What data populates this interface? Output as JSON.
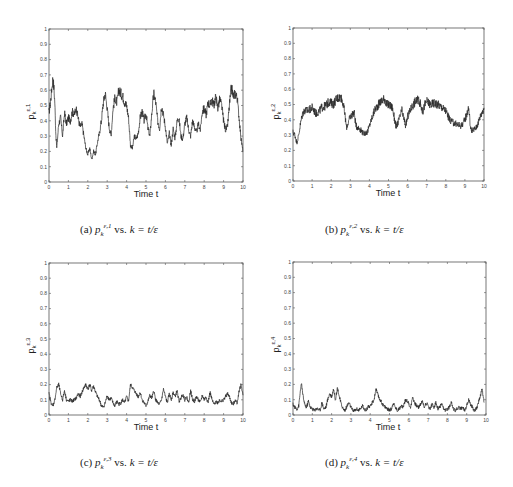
{
  "figure": {
    "captions": [
      {
        "label": "(a)",
        "symbol": "p",
        "sub": "k",
        "sup": "ε,1",
        "text": " vs. ",
        "rhs": "k = t/ε"
      },
      {
        "label": "(b)",
        "symbol": "p",
        "sub": "k",
        "sup": "ε,2",
        "text": " vs. ",
        "rhs": "k = t/ε"
      },
      {
        "label": "(c)",
        "symbol": "p",
        "sub": "k",
        "sup": "ε,3",
        "text": " vs. ",
        "rhs": "k = t/ε"
      },
      {
        "label": "(d)",
        "symbol": "p",
        "sub": "k",
        "sup": "ε,4",
        "text": " vs. ",
        "rhs": "k = t/ε"
      }
    ],
    "line_color": "#2a2a2a",
    "axis_color": "#555555"
  },
  "chart_data": [
    {
      "type": "line",
      "title": "(a) p_k^{ε,1} vs. k = t/ε",
      "xlabel": "Time t",
      "ylabel": "p_k^{ε,1}",
      "xlim": [
        0,
        10
      ],
      "ylim": [
        0,
        1
      ],
      "xticks": [
        0,
        1,
        2,
        3,
        4,
        5,
        6,
        7,
        8,
        9,
        10
      ],
      "yticks": [
        0,
        0.1,
        0.2,
        0.3,
        0.4,
        0.5,
        0.6,
        0.7,
        0.8,
        0.9,
        1
      ],
      "grid": false,
      "x": [
        0,
        0.1,
        0.2,
        0.25,
        0.3,
        0.35,
        0.4,
        0.5,
        0.6,
        0.7,
        0.8,
        0.9,
        1.0,
        1.1,
        1.2,
        1.3,
        1.4,
        1.5,
        1.6,
        1.7,
        1.8,
        1.9,
        2.0,
        2.1,
        2.2,
        2.3,
        2.4,
        2.5,
        2.6,
        2.7,
        2.8,
        2.9,
        3.0,
        3.1,
        3.2,
        3.3,
        3.4,
        3.5,
        3.6,
        3.7,
        3.8,
        3.9,
        4.0,
        4.1,
        4.2,
        4.3,
        4.4,
        4.5,
        4.6,
        4.7,
        4.8,
        4.9,
        5.0,
        5.1,
        5.2,
        5.3,
        5.4,
        5.5,
        5.6,
        5.7,
        5.8,
        5.9,
        6.0,
        6.1,
        6.2,
        6.3,
        6.4,
        6.5,
        6.6,
        6.7,
        6.8,
        6.9,
        7.0,
        7.1,
        7.2,
        7.3,
        7.4,
        7.5,
        7.6,
        7.7,
        7.8,
        7.9,
        8.0,
        8.1,
        8.2,
        8.3,
        8.4,
        8.5,
        8.6,
        8.7,
        8.8,
        8.9,
        9.0,
        9.1,
        9.2,
        9.3,
        9.4,
        9.5,
        9.6,
        9.7,
        9.8,
        9.9,
        10.0
      ],
      "values": [
        0.45,
        0.55,
        0.68,
        0.62,
        0.52,
        0.32,
        0.22,
        0.38,
        0.42,
        0.3,
        0.45,
        0.38,
        0.42,
        0.4,
        0.46,
        0.44,
        0.48,
        0.42,
        0.36,
        0.38,
        0.3,
        0.22,
        0.18,
        0.22,
        0.15,
        0.2,
        0.18,
        0.26,
        0.32,
        0.4,
        0.52,
        0.58,
        0.48,
        0.36,
        0.3,
        0.48,
        0.55,
        0.52,
        0.6,
        0.58,
        0.56,
        0.52,
        0.5,
        0.42,
        0.24,
        0.22,
        0.3,
        0.28,
        0.32,
        0.42,
        0.46,
        0.4,
        0.45,
        0.35,
        0.3,
        0.45,
        0.58,
        0.52,
        0.4,
        0.35,
        0.5,
        0.44,
        0.36,
        0.25,
        0.32,
        0.24,
        0.35,
        0.28,
        0.4,
        0.42,
        0.3,
        0.28,
        0.38,
        0.42,
        0.34,
        0.3,
        0.4,
        0.36,
        0.32,
        0.38,
        0.34,
        0.46,
        0.48,
        0.44,
        0.52,
        0.5,
        0.54,
        0.5,
        0.56,
        0.48,
        0.54,
        0.5,
        0.4,
        0.34,
        0.36,
        0.5,
        0.62,
        0.56,
        0.58,
        0.55,
        0.42,
        0.28,
        0.2
      ]
    },
    {
      "type": "line",
      "title": "(b) p_k^{ε,2} vs. k = t/ε",
      "xlabel": "Time t",
      "ylabel": "p_k^{ε,2}",
      "xlim": [
        0,
        10
      ],
      "ylim": [
        0,
        1
      ],
      "xticks": [
        0,
        1,
        2,
        3,
        4,
        5,
        6,
        7,
        8,
        9,
        10
      ],
      "yticks": [
        0,
        0.1,
        0.2,
        0.3,
        0.4,
        0.5,
        0.6,
        0.7,
        0.8,
        0.9,
        1
      ],
      "grid": false,
      "x": [
        0,
        0.1,
        0.2,
        0.3,
        0.4,
        0.5,
        0.6,
        0.8,
        1.0,
        1.2,
        1.4,
        1.5,
        1.7,
        1.9,
        2.1,
        2.3,
        2.5,
        2.6,
        2.7,
        2.8,
        3.0,
        3.2,
        3.3,
        3.5,
        3.7,
        3.9,
        4.1,
        4.3,
        4.6,
        4.8,
        4.9,
        5.0,
        5.2,
        5.4,
        5.6,
        5.7,
        5.9,
        6.0,
        6.2,
        6.4,
        6.6,
        6.8,
        6.9,
        7.0,
        7.2,
        7.4,
        7.6,
        7.8,
        8.0,
        8.2,
        8.4,
        8.6,
        8.8,
        9.0,
        9.2,
        9.3,
        9.4,
        9.6,
        9.8,
        10.0
      ],
      "values": [
        0.32,
        0.3,
        0.25,
        0.3,
        0.38,
        0.44,
        0.46,
        0.46,
        0.48,
        0.44,
        0.46,
        0.48,
        0.49,
        0.52,
        0.5,
        0.54,
        0.55,
        0.52,
        0.45,
        0.35,
        0.42,
        0.45,
        0.36,
        0.34,
        0.31,
        0.32,
        0.4,
        0.47,
        0.52,
        0.54,
        0.5,
        0.5,
        0.48,
        0.35,
        0.42,
        0.46,
        0.36,
        0.42,
        0.48,
        0.52,
        0.53,
        0.45,
        0.5,
        0.52,
        0.5,
        0.51,
        0.5,
        0.48,
        0.46,
        0.4,
        0.38,
        0.37,
        0.36,
        0.4,
        0.48,
        0.34,
        0.33,
        0.35,
        0.42,
        0.48
      ]
    },
    {
      "type": "line",
      "title": "(c) p_k^{ε,3} vs. k = t/ε",
      "xlabel": "Time t",
      "ylabel": "p_k^{ε,3}",
      "xlim": [
        0,
        10
      ],
      "ylim": [
        0,
        1
      ],
      "xticks": [
        0,
        1,
        2,
        3,
        4,
        5,
        6,
        7,
        8,
        9,
        10
      ],
      "yticks": [
        0,
        0.1,
        0.2,
        0.3,
        0.4,
        0.5,
        0.6,
        0.7,
        0.8,
        0.9,
        1
      ],
      "grid": false,
      "x": [
        0,
        0.1,
        0.2,
        0.3,
        0.4,
        0.5,
        0.6,
        0.7,
        0.8,
        0.9,
        1.0,
        1.1,
        1.2,
        1.3,
        1.4,
        1.5,
        1.6,
        1.7,
        1.8,
        1.9,
        2.0,
        2.1,
        2.2,
        2.3,
        2.4,
        2.5,
        2.6,
        2.7,
        2.8,
        2.9,
        3.0,
        3.1,
        3.2,
        3.3,
        3.4,
        3.5,
        3.6,
        3.7,
        3.8,
        3.9,
        4.0,
        4.1,
        4.2,
        4.3,
        4.4,
        4.5,
        4.6,
        4.7,
        4.8,
        4.9,
        5.0,
        5.1,
        5.2,
        5.3,
        5.4,
        5.5,
        5.6,
        5.7,
        5.8,
        5.9,
        6.0,
        6.1,
        6.2,
        6.3,
        6.4,
        6.5,
        6.6,
        6.7,
        6.8,
        6.9,
        7.0,
        7.1,
        7.2,
        7.3,
        7.4,
        7.5,
        7.6,
        7.7,
        7.8,
        7.9,
        8.0,
        8.1,
        8.2,
        8.3,
        8.4,
        8.5,
        8.6,
        8.7,
        8.8,
        8.9,
        9.0,
        9.1,
        9.2,
        9.3,
        9.4,
        9.5,
        9.6,
        9.7,
        9.8,
        9.9,
        10.0
      ],
      "values": [
        0.14,
        0.08,
        0.06,
        0.1,
        0.18,
        0.2,
        0.14,
        0.1,
        0.16,
        0.1,
        0.09,
        0.1,
        0.09,
        0.1,
        0.11,
        0.14,
        0.12,
        0.15,
        0.18,
        0.2,
        0.17,
        0.2,
        0.16,
        0.19,
        0.15,
        0.12,
        0.1,
        0.06,
        0.05,
        0.08,
        0.13,
        0.1,
        0.11,
        0.08,
        0.06,
        0.09,
        0.07,
        0.08,
        0.1,
        0.08,
        0.12,
        0.09,
        0.2,
        0.18,
        0.16,
        0.14,
        0.12,
        0.15,
        0.1,
        0.08,
        0.06,
        0.09,
        0.13,
        0.11,
        0.16,
        0.1,
        0.08,
        0.07,
        0.1,
        0.17,
        0.12,
        0.08,
        0.14,
        0.1,
        0.15,
        0.12,
        0.16,
        0.09,
        0.11,
        0.14,
        0.1,
        0.12,
        0.08,
        0.16,
        0.1,
        0.09,
        0.12,
        0.1,
        0.08,
        0.13,
        0.1,
        0.12,
        0.08,
        0.15,
        0.1,
        0.07,
        0.09,
        0.08,
        0.1,
        0.09,
        0.1,
        0.12,
        0.14,
        0.12,
        0.08,
        0.07,
        0.1,
        0.08,
        0.16,
        0.2,
        0.13
      ]
    },
    {
      "type": "line",
      "title": "(d) p_k^{ε,4} vs. k = t/ε",
      "xlabel": "Time t",
      "ylabel": "p_k^{ε,4}",
      "xlim": [
        0,
        10
      ],
      "ylim": [
        0,
        1
      ],
      "xticks": [
        0,
        1,
        2,
        3,
        4,
        5,
        6,
        7,
        8,
        9,
        10
      ],
      "yticks": [
        0,
        0.1,
        0.2,
        0.3,
        0.4,
        0.5,
        0.6,
        0.7,
        0.8,
        0.9,
        1
      ],
      "grid": false,
      "x": [
        0,
        0.1,
        0.2,
        0.3,
        0.4,
        0.45,
        0.5,
        0.6,
        0.7,
        0.8,
        0.9,
        1.0,
        1.1,
        1.2,
        1.3,
        1.4,
        1.5,
        1.6,
        1.7,
        1.8,
        1.9,
        2.0,
        2.1,
        2.2,
        2.3,
        2.4,
        2.5,
        2.6,
        2.7,
        2.8,
        2.9,
        3.0,
        3.1,
        3.2,
        3.3,
        3.4,
        3.5,
        3.6,
        3.7,
        3.8,
        3.9,
        4.0,
        4.1,
        4.2,
        4.3,
        4.4,
        4.5,
        4.6,
        4.7,
        4.8,
        4.9,
        5.0,
        5.1,
        5.2,
        5.3,
        5.4,
        5.5,
        5.6,
        5.7,
        5.8,
        5.9,
        6.0,
        6.1,
        6.2,
        6.3,
        6.4,
        6.5,
        6.6,
        6.7,
        6.8,
        6.9,
        7.0,
        7.1,
        7.2,
        7.3,
        7.4,
        7.5,
        7.6,
        7.7,
        7.8,
        7.9,
        8.0,
        8.1,
        8.2,
        8.3,
        8.4,
        8.5,
        8.6,
        8.7,
        8.8,
        8.9,
        9.0,
        9.1,
        9.2,
        9.3,
        9.4,
        9.5,
        9.6,
        9.7,
        9.8,
        9.9,
        10.0
      ],
      "values": [
        0.07,
        0.05,
        0.04,
        0.06,
        0.18,
        0.2,
        0.14,
        0.07,
        0.05,
        0.09,
        0.05,
        0.04,
        0.03,
        0.04,
        0.04,
        0.03,
        0.08,
        0.04,
        0.05,
        0.1,
        0.14,
        0.12,
        0.17,
        0.1,
        0.18,
        0.12,
        0.07,
        0.04,
        0.03,
        0.06,
        0.08,
        0.05,
        0.03,
        0.03,
        0.04,
        0.03,
        0.04,
        0.06,
        0.04,
        0.03,
        0.06,
        0.05,
        0.08,
        0.1,
        0.17,
        0.13,
        0.1,
        0.08,
        0.06,
        0.05,
        0.04,
        0.03,
        0.04,
        0.08,
        0.05,
        0.03,
        0.04,
        0.06,
        0.05,
        0.09,
        0.1,
        0.07,
        0.05,
        0.12,
        0.08,
        0.06,
        0.05,
        0.07,
        0.09,
        0.05,
        0.08,
        0.06,
        0.04,
        0.07,
        0.05,
        0.08,
        0.04,
        0.05,
        0.07,
        0.04,
        0.03,
        0.04,
        0.05,
        0.09,
        0.04,
        0.03,
        0.04,
        0.05,
        0.04,
        0.05,
        0.03,
        0.06,
        0.1,
        0.07,
        0.05,
        0.03,
        0.04,
        0.08,
        0.12,
        0.17,
        0.08
      ]
    }
  ]
}
